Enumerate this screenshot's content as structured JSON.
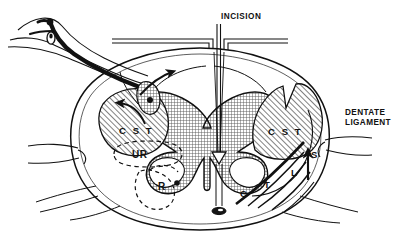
{
  "figure": {
    "background_color": "#ffffff",
    "ink_color": "#111111",
    "width": 400,
    "height": 238
  },
  "labels": {
    "incision": "INCISION",
    "dentate_ligament": "DENTATE\nLIGAMENT",
    "cst_left": "C S T",
    "cst_right": "C S T",
    "ur": "UR",
    "r": "R",
    "lamination_c": "C",
    "lamination_t": "T",
    "lamination_l": "L",
    "lamination_s": "S"
  },
  "legend_meaning": {
    "cst": "corticospinal tract",
    "ur": "unmyelinated region outline",
    "r": "reflex region marker",
    "c": "cervical",
    "t": "thoracic",
    "l": "lumbar",
    "s": "sacral"
  },
  "structures": {
    "cord_outline": "oval spinal cord cross-section",
    "gray_matter": "butterfly-shaped central gray matter, crosshatch fill",
    "cst_patches": "two diagonally hatched corticospinal tract zones",
    "dorsal_root_ganglion": "left upper nerve root with ganglion",
    "anterior_spinal_artery": "small dark vessel at anterior median fissure",
    "incision_line": "vertical double line at posterior median sulcus",
    "dura": "horizontal double lines flanking the incision",
    "arrows": [
      "curved arrow into left corticospinal tract",
      "curved arrow along dorsal root entry zone",
      "straight arrow upward along lamination sequence"
    ]
  },
  "colors": {
    "ink": "#111111",
    "hatch": "#2b2b2b",
    "gray_matter_fill": "#9a9a9a",
    "paper": "#ffffff"
  }
}
